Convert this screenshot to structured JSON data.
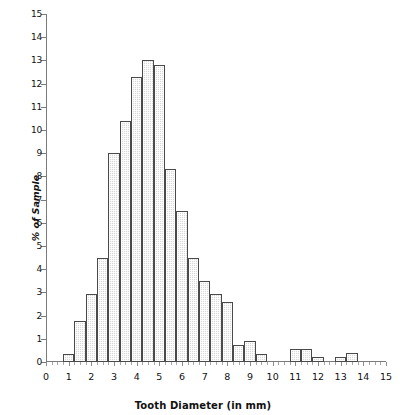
{
  "chart_data": {
    "type": "bar",
    "title": "",
    "xlabel": "Tooth Diameter (in mm)",
    "ylabel": "% of Sample",
    "xlim": [
      0,
      15
    ],
    "ylim": [
      0,
      15
    ],
    "grid": false,
    "legend": null,
    "bin_width": 0.5,
    "y_ticks": [
      0,
      1,
      2,
      3,
      4,
      5,
      6,
      7,
      8,
      9,
      10,
      11,
      12,
      13,
      14,
      15
    ],
    "y_tick_labels": [
      "0",
      "1",
      "2",
      "3",
      "4",
      "5",
      "6",
      "7",
      "8",
      "9",
      "10",
      "11",
      "12",
      "13",
      "14",
      "15"
    ],
    "x_ticks": [
      0,
      1,
      2,
      3,
      4,
      5,
      6,
      7,
      8,
      9,
      10,
      11,
      12,
      13,
      14,
      15
    ],
    "x_tick_labels": [
      "0",
      "1",
      "2",
      "3",
      "4",
      "5",
      "6",
      "7",
      "8",
      "9",
      "10",
      "11",
      "12",
      "13",
      "14",
      "15"
    ],
    "bin_starts": [
      0.75,
      1.25,
      1.75,
      2.25,
      2.75,
      3.25,
      3.75,
      4.25,
      4.75,
      5.25,
      5.75,
      6.25,
      6.75,
      7.25,
      7.75,
      8.25,
      8.75,
      9.25,
      10.75,
      11.25,
      11.75,
      12.75,
      13.25
    ],
    "categories": [
      "0.75-1.25",
      "1.25-1.75",
      "1.75-2.25",
      "2.25-2.75",
      "2.75-3.25",
      "3.25-3.75",
      "3.75-4.25",
      "4.25-4.75",
      "4.75-5.25",
      "5.25-5.75",
      "5.75-6.25",
      "6.25-6.75",
      "6.75-7.25",
      "7.25-7.75",
      "7.75-8.25",
      "8.25-8.75",
      "8.75-9.25",
      "9.25-9.75",
      "10.75-11.25",
      "11.25-11.75",
      "11.75-12.25",
      "12.75-13.25",
      "13.25-13.75"
    ],
    "values": [
      0.35,
      1.75,
      2.95,
      4.5,
      9.0,
      10.4,
      12.3,
      13.0,
      12.8,
      8.3,
      6.5,
      4.5,
      3.5,
      2.95,
      2.6,
      0.75,
      0.9,
      0.35,
      0.55,
      0.55,
      0.2,
      0.2,
      0.4
    ]
  },
  "colors": {
    "bar_fill": "#d8d8d8",
    "bar_edge": "#4a4a4a",
    "axis": "#7b7b7b",
    "text": "#111111",
    "background": "#ffffff"
  }
}
